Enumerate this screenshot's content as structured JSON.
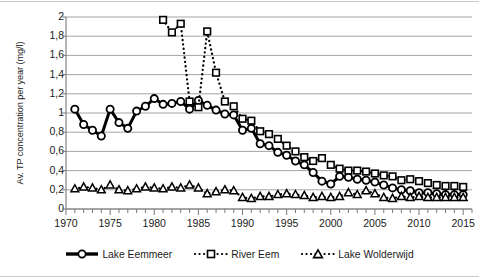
{
  "chart_data": {
    "type": "line",
    "title": "",
    "xlabel": "",
    "ylabel": "Av. TP concentration per year (mg/l)",
    "xlim": [
      1970,
      2016
    ],
    "ylim": [
      0,
      2
    ],
    "ytick_labels": [
      "0",
      "0,2",
      "0,4",
      "0,6",
      "0,8",
      "1",
      "1,2",
      "1,4",
      "1,6",
      "1,8",
      "2"
    ],
    "ytick_values": [
      0,
      0.2,
      0.4,
      0.6,
      0.8,
      1.0,
      1.2,
      1.4,
      1.6,
      1.8,
      2.0
    ],
    "xtick_labels": [
      "1970",
      "1975",
      "1980",
      "1985",
      "1990",
      "1995",
      "2000",
      "2005",
      "2010",
      "2015"
    ],
    "xtick_values": [
      1970,
      1975,
      1980,
      1985,
      1990,
      1995,
      2000,
      2005,
      2010,
      2015
    ],
    "xtick_minor_step": 1,
    "grid": "horizontal",
    "legend_position": "bottom",
    "decimal_separator": ",",
    "series": [
      {
        "name": "Lake Eemmeer",
        "marker": "circle-open",
        "line": "solid",
        "color": "#000000",
        "x": [
          1971,
          1972,
          1973,
          1974,
          1975,
          1976,
          1977,
          1978,
          1979,
          1980,
          1981,
          1982,
          1983,
          1984,
          1985,
          1986,
          1987,
          1988,
          1989,
          1990,
          1991,
          1992,
          1993,
          1994,
          1995,
          1996,
          1997,
          1998,
          1999,
          2000,
          2001,
          2002,
          2003,
          2004,
          2005,
          2006,
          2007,
          2008,
          2009,
          2010,
          2011,
          2012,
          2013,
          2014,
          2015
        ],
        "y": [
          1.04,
          0.88,
          0.82,
          0.76,
          1.04,
          0.9,
          0.84,
          1.02,
          1.07,
          1.15,
          1.09,
          1.1,
          1.12,
          1.04,
          1.13,
          1.08,
          1.03,
          0.99,
          0.98,
          0.82,
          0.84,
          0.68,
          0.66,
          0.59,
          0.56,
          0.5,
          0.46,
          0.38,
          0.29,
          0.26,
          0.34,
          0.33,
          0.31,
          0.3,
          0.28,
          0.25,
          0.22,
          0.2,
          0.19,
          0.17,
          0.17,
          0.16,
          0.15,
          0.15,
          0.15
        ]
      },
      {
        "name": "River Eem",
        "marker": "square-open",
        "line": "dotted",
        "color": "#000000",
        "x": [
          1981,
          1982,
          1983,
          1984,
          1985,
          1986,
          1987,
          1988,
          1989,
          1990,
          1991,
          1992,
          1993,
          1994,
          1995,
          1996,
          1997,
          1998,
          1999,
          2000,
          2001,
          2002,
          2003,
          2004,
          2005,
          2006,
          2007,
          2008,
          2009,
          2010,
          2011,
          2012,
          2013,
          2014,
          2015
        ],
        "y": [
          1.97,
          1.84,
          1.93,
          1.12,
          1.06,
          1.85,
          1.42,
          1.12,
          1.07,
          0.94,
          0.92,
          0.81,
          0.78,
          0.73,
          0.66,
          0.6,
          0.54,
          0.5,
          0.53,
          0.46,
          0.42,
          0.4,
          0.4,
          0.39,
          0.37,
          0.35,
          0.34,
          0.3,
          0.31,
          0.29,
          0.27,
          0.25,
          0.24,
          0.24,
          0.23
        ]
      },
      {
        "name": "Lake Wolderwijd",
        "marker": "triangle-open",
        "line": "dotted",
        "color": "#000000",
        "x": [
          1971,
          1972,
          1973,
          1974,
          1975,
          1976,
          1977,
          1978,
          1979,
          1980,
          1981,
          1982,
          1983,
          1984,
          1985,
          1986,
          1987,
          1988,
          1989,
          1990,
          1991,
          1992,
          1993,
          1994,
          1995,
          1996,
          1997,
          1998,
          1999,
          2000,
          2001,
          2002,
          2003,
          2004,
          2005,
          2006,
          2007,
          2008,
          2009,
          2010,
          2011,
          2012,
          2013,
          2014,
          2015
        ],
        "y": [
          0.21,
          0.23,
          0.22,
          0.2,
          0.25,
          0.2,
          0.19,
          0.21,
          0.23,
          0.22,
          0.21,
          0.23,
          0.22,
          0.25,
          0.22,
          0.16,
          0.18,
          0.2,
          0.19,
          0.12,
          0.11,
          0.13,
          0.13,
          0.15,
          0.16,
          0.15,
          0.14,
          0.12,
          0.13,
          0.12,
          0.13,
          0.17,
          0.15,
          0.19,
          0.16,
          0.12,
          0.11,
          0.13,
          0.12,
          0.13,
          0.12,
          0.12,
          0.12,
          0.12,
          0.12
        ]
      }
    ]
  },
  "legend": {
    "items": [
      {
        "label": "Lake Eemmeer",
        "key": "solid-line-circle-marker"
      },
      {
        "label": "River Eem",
        "key": "dotted-line-square-marker"
      },
      {
        "label": "Lake Wolderwijd",
        "key": "dotted-line-triangle-marker"
      }
    ]
  },
  "colors": {
    "grid": "#9a9a9a",
    "axis": "#7a7a7a",
    "series": "#000000",
    "text": "#1b1b1b",
    "background": "#ffffff"
  }
}
